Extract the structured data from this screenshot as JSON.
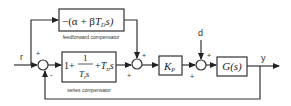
{
  "diagram": {
    "signals": {
      "r": "r",
      "d": "d",
      "y": "y"
    },
    "feedforward": {
      "expr_pre": "−(α + β",
      "expr_T": "T",
      "expr_sub": "D",
      "expr_post": "s)",
      "label": "feedforward compensator"
    },
    "series": {
      "one": "1+",
      "num": "1",
      "den_T": "T",
      "den_sub": "I",
      "den_s": "s",
      "plus": "+",
      "td_T": "T",
      "td_sub": "D",
      "td_s": "s",
      "label": "series compensator"
    },
    "gain": {
      "K": "K",
      "sub": "P"
    },
    "plant": {
      "label": "G(s)"
    },
    "signs": {
      "sum1_top": "+",
      "sum1_bottom": "-",
      "sum2_top": "+",
      "sum2_bottom": "+",
      "sum3_top": "+",
      "sum3_bottom": "+"
    }
  }
}
